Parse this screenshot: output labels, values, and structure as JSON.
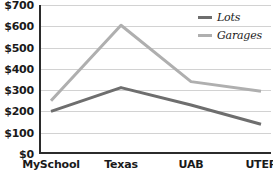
{
  "chart_data": {
    "type": "line",
    "title": "",
    "xlabel": "",
    "ylabel": "",
    "categories": [
      "MySchool",
      "Texas",
      "UAB",
      "UTEP"
    ],
    "series": [
      {
        "name": "Lots",
        "color": "#6e6e6e",
        "values": [
          200,
          312,
          230,
          140
        ]
      },
      {
        "name": "Garages",
        "color": "#afafaf",
        "values": [
          250,
          605,
          340,
          295
        ]
      }
    ],
    "ylim": [
      0,
      700
    ],
    "ytick_step": 100,
    "ytick_labels": [
      "$0",
      "$100",
      "$200",
      "$300",
      "$400",
      "$500",
      "$600",
      "$700"
    ],
    "ytick_values": [
      0,
      100,
      200,
      300,
      400,
      500,
      600,
      700
    ],
    "grid": true,
    "legend_position": "top-right"
  },
  "axis": {
    "axis_color": "#2b2b2b",
    "gridline_color": "#d2d2d2"
  },
  "legend": {
    "entries": [
      {
        "label": "Lots",
        "color": "#6e6e6e"
      },
      {
        "label": "Garages",
        "color": "#afafaf"
      }
    ]
  }
}
